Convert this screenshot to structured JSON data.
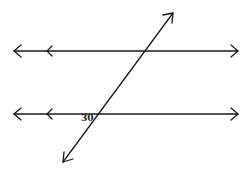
{
  "diagram": {
    "type": "parallel-lines-transversal",
    "lines": [
      {
        "name": "top-parallel-line",
        "y": 51,
        "x1": 14,
        "x2": 238
      },
      {
        "name": "bottom-parallel-line",
        "y": 114,
        "x1": 14,
        "x2": 238
      }
    ],
    "transversal": {
      "x1": 63,
      "y1": 162,
      "x2": 173,
      "y2": 13
    },
    "angle_label": "30",
    "stroke_color": "#1a1a1a"
  }
}
